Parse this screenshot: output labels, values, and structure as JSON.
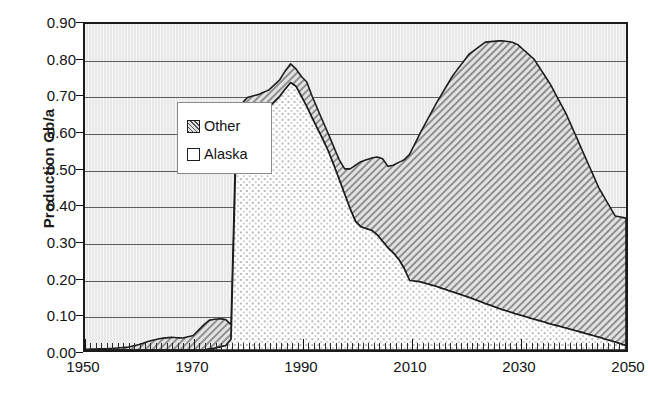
{
  "chart_data": {
    "type": "area",
    "title": "",
    "subtitle": "",
    "xlabel": "",
    "ylabel": "Production Gb/a",
    "stacked": true,
    "grid": true,
    "legend_position": "inside-top-left",
    "xlim": [
      1950,
      2050
    ],
    "ylim": [
      0.0,
      0.9
    ],
    "xticks": [
      1950,
      1970,
      1990,
      2010,
      2030,
      2050
    ],
    "xtick_labels": [
      "1950",
      "1970",
      "1990",
      "2010",
      "2030",
      "2050"
    ],
    "yticks": [
      0.0,
      0.1,
      0.2,
      0.3,
      0.4,
      0.5,
      0.6,
      0.7,
      0.8,
      0.9
    ],
    "ytick_labels": [
      "0.00",
      "0.10",
      "0.20",
      "0.30",
      "0.40",
      "0.50",
      "0.60",
      "0.70",
      "0.80",
      "0.90"
    ],
    "legend": [
      "Other",
      "Alaska"
    ],
    "series": [
      {
        "name": "Alaska",
        "fill": "dotted",
        "values": [
          [
            1950,
            0.0
          ],
          [
            1955,
            0.0
          ],
          [
            1958,
            0.0
          ],
          [
            1960,
            0.0
          ],
          [
            1962,
            0.0
          ],
          [
            1964,
            0.0
          ],
          [
            1966,
            0.0
          ],
          [
            1968,
            0.0
          ],
          [
            1970,
            0.0
          ],
          [
            1972,
            0.0
          ],
          [
            1974,
            0.005
          ],
          [
            1976,
            0.012
          ],
          [
            1977,
            0.03
          ],
          [
            1978,
            0.6
          ],
          [
            1979,
            0.63
          ],
          [
            1980,
            0.645
          ],
          [
            1982,
            0.655
          ],
          [
            1984,
            0.67
          ],
          [
            1986,
            0.7
          ],
          [
            1987,
            0.72
          ],
          [
            1988,
            0.738
          ],
          [
            1989,
            0.728
          ],
          [
            1990,
            0.7
          ],
          [
            1991,
            0.672
          ],
          [
            1992,
            0.64
          ],
          [
            1993,
            0.61
          ],
          [
            1994,
            0.58
          ],
          [
            1995,
            0.548
          ],
          [
            1996,
            0.51
          ],
          [
            1997,
            0.47
          ],
          [
            1998,
            0.43
          ],
          [
            1999,
            0.39
          ],
          [
            2000,
            0.355
          ],
          [
            2001,
            0.34
          ],
          [
            2002,
            0.335
          ],
          [
            2003,
            0.33
          ],
          [
            2004,
            0.318
          ],
          [
            2005,
            0.3
          ],
          [
            2006,
            0.282
          ],
          [
            2007,
            0.268
          ],
          [
            2008,
            0.25
          ],
          [
            2009,
            0.225
          ],
          [
            2010,
            0.192
          ],
          [
            2012,
            0.188
          ],
          [
            2015,
            0.175
          ],
          [
            2018,
            0.16
          ],
          [
            2021,
            0.145
          ],
          [
            2024,
            0.128
          ],
          [
            2027,
            0.112
          ],
          [
            2030,
            0.098
          ],
          [
            2033,
            0.085
          ],
          [
            2036,
            0.072
          ],
          [
            2039,
            0.06
          ],
          [
            2042,
            0.048
          ],
          [
            2045,
            0.035
          ],
          [
            2048,
            0.022
          ],
          [
            2050,
            0.012
          ]
        ]
      },
      {
        "name": "Other",
        "fill": "diagonal-hatch",
        "values": [
          [
            1950,
            0.002
          ],
          [
            1955,
            0.004
          ],
          [
            1958,
            0.008
          ],
          [
            1960,
            0.015
          ],
          [
            1962,
            0.025
          ],
          [
            1964,
            0.032
          ],
          [
            1966,
            0.035
          ],
          [
            1968,
            0.033
          ],
          [
            1970,
            0.04
          ],
          [
            1971,
            0.055
          ],
          [
            1972,
            0.07
          ],
          [
            1973,
            0.08
          ],
          [
            1974,
            0.08
          ],
          [
            1975,
            0.078
          ],
          [
            1976,
            0.072
          ],
          [
            1977,
            0.04
          ],
          [
            1978,
            0.048
          ],
          [
            1979,
            0.05
          ],
          [
            1980,
            0.052
          ],
          [
            1982,
            0.05
          ],
          [
            1984,
            0.048
          ],
          [
            1986,
            0.046
          ],
          [
            1987,
            0.05
          ],
          [
            1988,
            0.052
          ],
          [
            1989,
            0.048
          ],
          [
            1990,
            0.055
          ],
          [
            1991,
            0.068
          ],
          [
            1992,
            0.06
          ],
          [
            1993,
            0.055
          ],
          [
            1994,
            0.05
          ],
          [
            1995,
            0.048
          ],
          [
            1996,
            0.05
          ],
          [
            1997,
            0.055
          ],
          [
            1998,
            0.07
          ],
          [
            1999,
            0.11
          ],
          [
            2000,
            0.155
          ],
          [
            2001,
            0.18
          ],
          [
            2002,
            0.19
          ],
          [
            2003,
            0.2
          ],
          [
            2004,
            0.215
          ],
          [
            2005,
            0.228
          ],
          [
            2006,
            0.225
          ],
          [
            2007,
            0.242
          ],
          [
            2008,
            0.268
          ],
          [
            2009,
            0.3
          ],
          [
            2010,
            0.348
          ],
          [
            2012,
            0.412
          ],
          [
            2015,
            0.508
          ],
          [
            2018,
            0.598
          ],
          [
            2021,
            0.672
          ],
          [
            2024,
            0.722
          ],
          [
            2027,
            0.742
          ],
          [
            2029,
            0.747
          ],
          [
            2030,
            0.745
          ],
          [
            2033,
            0.718
          ],
          [
            2036,
            0.662
          ],
          [
            2039,
            0.59
          ],
          [
            2042,
            0.5
          ],
          [
            2045,
            0.412
          ],
          [
            2048,
            0.348
          ],
          [
            2050,
            0.352
          ]
        ]
      }
    ],
    "totals_note": {
      "early_bump_peak": 0.085,
      "first_peak_year": 1988,
      "first_peak_value": 0.79,
      "trough_year": 1999,
      "trough_value": 0.505,
      "second_peak_year": 2029,
      "second_peak_value": 0.845,
      "end_value_2050": 0.364
    }
  }
}
